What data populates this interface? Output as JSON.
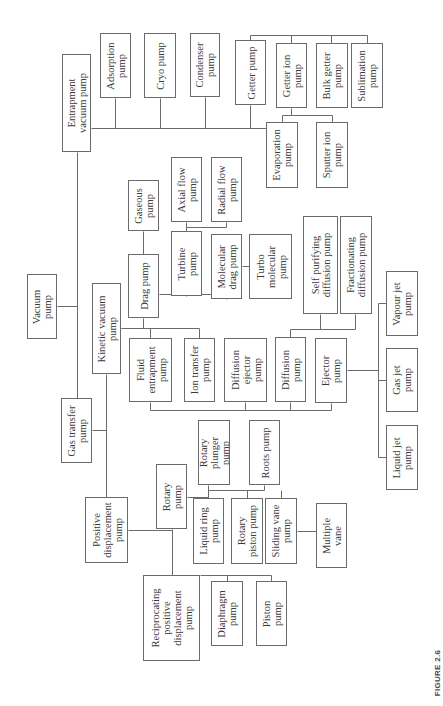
{
  "figure": {
    "caption": "FIGURE 2.6",
    "line_color": "#6b6b6b",
    "text_color": "#3a3a3a",
    "orientation": "rotated -90 degrees (text reads bottom-to-top)"
  },
  "nodes": [
    {
      "id": "vacuum",
      "label": "Vacuum\npump",
      "x": 27,
      "y": 274,
      "w": 30,
      "h": 65
    },
    {
      "id": "entrapment",
      "label": "Entrapment\nvacuum pump",
      "x": 62,
      "y": 54,
      "w": 29,
      "h": 98
    },
    {
      "id": "adsorption",
      "label": "Adsorption\npump",
      "x": 100,
      "y": 33,
      "w": 31,
      "h": 65
    },
    {
      "id": "cryo",
      "label": "Cryo pump",
      "x": 144,
      "y": 33,
      "w": 32,
      "h": 65
    },
    {
      "id": "condenser",
      "label": "Condenser\npump",
      "x": 190,
      "y": 33,
      "w": 30,
      "h": 64
    },
    {
      "id": "getter",
      "label": "Getter pump",
      "x": 235,
      "y": 40,
      "w": 31,
      "h": 65
    },
    {
      "id": "getter_ion",
      "label": "Getter ion\npump",
      "x": 276,
      "y": 43,
      "w": 31,
      "h": 65
    },
    {
      "id": "bulk_getter",
      "label": "Bulk getter\npump",
      "x": 316,
      "y": 43,
      "w": 32,
      "h": 65
    },
    {
      "id": "sublimation",
      "label": "Sublimation\npump",
      "x": 351,
      "y": 43,
      "w": 32,
      "h": 65
    },
    {
      "id": "evaporation",
      "label": "Evaporation\npump",
      "x": 266,
      "y": 122,
      "w": 32,
      "h": 66
    },
    {
      "id": "sputter_ion",
      "label": "Sputter ion\npump",
      "x": 316,
      "y": 122,
      "w": 32,
      "h": 66
    },
    {
      "id": "gas_transfer",
      "label": "Gas transfer\npump",
      "x": 61,
      "y": 398,
      "w": 31,
      "h": 65
    },
    {
      "id": "kinetic",
      "label": "Kinetic vacuum\npump",
      "x": 92,
      "y": 283,
      "w": 29,
      "h": 91
    },
    {
      "id": "drag",
      "label": "Drag pump",
      "x": 128,
      "y": 254,
      "w": 31,
      "h": 64
    },
    {
      "id": "gaseous",
      "label": "Gaseous\npump",
      "x": 128,
      "y": 180,
      "w": 31,
      "h": 51
    },
    {
      "id": "turbine",
      "label": "Turbine\npump",
      "x": 171,
      "y": 231,
      "w": 31,
      "h": 65
    },
    {
      "id": "axial_flow",
      "label": "Axial flow\npump",
      "x": 171,
      "y": 157,
      "w": 31,
      "h": 65
    },
    {
      "id": "radial_flow",
      "label": "Radial flow\npump",
      "x": 211,
      "y": 157,
      "w": 31,
      "h": 65
    },
    {
      "id": "molecular_drag",
      "label": "Molecular\ndrag pump",
      "x": 211,
      "y": 234,
      "w": 31,
      "h": 65
    },
    {
      "id": "turbo_molecular",
      "label": "Turbo\nmolecular\npump",
      "x": 249,
      "y": 234,
      "w": 43,
      "h": 65
    },
    {
      "id": "fluid_entrapment",
      "label": "Fluid\nentrapment\npump",
      "x": 129,
      "y": 338,
      "w": 43,
      "h": 64
    },
    {
      "id": "ion_transfer",
      "label": "Ion transfer\npump",
      "x": 184,
      "y": 338,
      "w": 31,
      "h": 64
    },
    {
      "id": "diffusion_ejector",
      "label": "Diffusion\nejector\npump",
      "x": 224,
      "y": 338,
      "w": 43,
      "h": 64
    },
    {
      "id": "diffusion",
      "label": "Diffusion\npump",
      "x": 275,
      "y": 337,
      "w": 31,
      "h": 65
    },
    {
      "id": "ejector",
      "label": "Ejector\npump",
      "x": 315,
      "y": 338,
      "w": 32,
      "h": 65
    },
    {
      "id": "self_purifying",
      "label": "Self purifying\ndiffusion pump",
      "x": 303,
      "y": 216,
      "w": 35,
      "h": 98
    },
    {
      "id": "fractionating",
      "label": "Fractionating\ndiffusion pump",
      "x": 340,
      "y": 216,
      "w": 32,
      "h": 98
    },
    {
      "id": "vapour_jet",
      "label": "Vapour jet\npump",
      "x": 386,
      "y": 271,
      "w": 32,
      "h": 65
    },
    {
      "id": "gas_jet",
      "label": "Gas jet\npump",
      "x": 386,
      "y": 348,
      "w": 32,
      "h": 64
    },
    {
      "id": "liquid_jet",
      "label": "Liquid jet\npump",
      "x": 386,
      "y": 425,
      "w": 32,
      "h": 65
    },
    {
      "id": "positive_displacement",
      "label": "Positive\ndisplacement\npump",
      "x": 85,
      "y": 497,
      "w": 43,
      "h": 66
    },
    {
      "id": "rotary",
      "label": "Rotary\npump",
      "x": 156,
      "y": 464,
      "w": 31,
      "h": 65
    },
    {
      "id": "rotary_plunger",
      "label": "Rotary\nplunger\npump",
      "x": 198,
      "y": 420,
      "w": 32,
      "h": 65
    },
    {
      "id": "roots",
      "label": "Roots pump",
      "x": 249,
      "y": 420,
      "w": 31,
      "h": 65
    },
    {
      "id": "liquid_ring",
      "label": "Liquid ring\npump",
      "x": 193,
      "y": 498,
      "w": 31,
      "h": 66
    },
    {
      "id": "rotary_piston",
      "label": "Rotary\npiston pump",
      "x": 231,
      "y": 498,
      "w": 32,
      "h": 66
    },
    {
      "id": "sliding_vane",
      "label": "Sliding vane\npump",
      "x": 265,
      "y": 498,
      "w": 32,
      "h": 66
    },
    {
      "id": "multiple_vane",
      "label": "Multiple\nvane",
      "x": 316,
      "y": 503,
      "w": 31,
      "h": 65
    },
    {
      "id": "reciprocating",
      "label": "Reciprocating\npositive\ndisplacement\npump",
      "x": 143,
      "y": 575,
      "w": 57,
      "h": 86
    },
    {
      "id": "diaphragm",
      "label": "Diaphragm\npump",
      "x": 211,
      "y": 581,
      "w": 32,
      "h": 65
    },
    {
      "id": "piston",
      "label": "Piston\npump",
      "x": 256,
      "y": 581,
      "w": 31,
      "h": 65
    }
  ],
  "edges": [
    [
      "vacuum",
      "entrapment"
    ],
    [
      "vacuum",
      "gas_transfer"
    ],
    [
      "entrapment",
      "adsorption"
    ],
    [
      "entrapment",
      "cryo"
    ],
    [
      "entrapment",
      "condenser"
    ],
    [
      "entrapment",
      "getter"
    ],
    [
      "getter",
      "getter_ion"
    ],
    [
      "getter",
      "bulk_getter"
    ],
    [
      "getter",
      "sublimation"
    ],
    [
      "getter_ion",
      "evaporation"
    ],
    [
      "getter_ion",
      "sputter_ion"
    ],
    [
      "gas_transfer",
      "kinetic"
    ],
    [
      "gas_transfer",
      "positive_displacement"
    ],
    [
      "kinetic",
      "drag"
    ],
    [
      "kinetic",
      "fluid_entrapment"
    ],
    [
      "kinetic",
      "ion_transfer"
    ],
    [
      "drag",
      "gaseous"
    ],
    [
      "drag",
      "turbine"
    ],
    [
      "drag",
      "molecular_drag"
    ],
    [
      "turbine",
      "axial_flow"
    ],
    [
      "turbine",
      "radial_flow"
    ],
    [
      "molecular_drag",
      "turbo_molecular"
    ],
    [
      "fluid_entrapment",
      "diffusion_ejector"
    ],
    [
      "fluid_entrapment",
      "diffusion"
    ],
    [
      "fluid_entrapment",
      "ejector"
    ],
    [
      "diffusion",
      "self_purifying"
    ],
    [
      "diffusion",
      "fractionating"
    ],
    [
      "ejector",
      "vapour_jet"
    ],
    [
      "ejector",
      "gas_jet"
    ],
    [
      "ejector",
      "liquid_jet"
    ],
    [
      "positive_displacement",
      "rotary"
    ],
    [
      "positive_displacement",
      "reciprocating"
    ],
    [
      "rotary",
      "rotary_plunger"
    ],
    [
      "rotary",
      "roots"
    ],
    [
      "rotary",
      "liquid_ring"
    ],
    [
      "rotary",
      "rotary_piston"
    ],
    [
      "rotary",
      "sliding_vane"
    ],
    [
      "sliding_vane",
      "multiple_vane"
    ],
    [
      "reciprocating",
      "diaphragm"
    ],
    [
      "reciprocating",
      "piston"
    ]
  ],
  "lines": [
    [
      57,
      306,
      77,
      306
    ],
    [
      77,
      152,
      77,
      398
    ],
    [
      91,
      128,
      266,
      128
    ],
    [
      115,
      98,
      115,
      128
    ],
    [
      160,
      98,
      160,
      128
    ],
    [
      205,
      97,
      205,
      128
    ],
    [
      250,
      105,
      250,
      128
    ],
    [
      250,
      40,
      250,
      35
    ],
    [
      250,
      35,
      367,
      35
    ],
    [
      291,
      35,
      291,
      43
    ],
    [
      331,
      35,
      331,
      43
    ],
    [
      367,
      35,
      367,
      43
    ],
    [
      291,
      108,
      291,
      115
    ],
    [
      282,
      115,
      332,
      115
    ],
    [
      282,
      115,
      282,
      122
    ],
    [
      332,
      115,
      332,
      122
    ],
    [
      92,
      430,
      106,
      430
    ],
    [
      106,
      374,
      106,
      497
    ],
    [
      121,
      328,
      143,
      328
    ],
    [
      143,
      318,
      143,
      328
    ],
    [
      121,
      328,
      199,
      328
    ],
    [
      150,
      328,
      150,
      338
    ],
    [
      199,
      328,
      199,
      338
    ],
    [
      143,
      231,
      143,
      254
    ],
    [
      159,
      294,
      226,
      294
    ],
    [
      186,
      296,
      186,
      294
    ],
    [
      226,
      299,
      226,
      294
    ],
    [
      186,
      222,
      186,
      231
    ],
    [
      186,
      227,
      226,
      227
    ],
    [
      226,
      222,
      226,
      227
    ],
    [
      242,
      266,
      249,
      266
    ],
    [
      150,
      402,
      150,
      410
    ],
    [
      150,
      410,
      331,
      410
    ],
    [
      245,
      402,
      245,
      410
    ],
    [
      290,
      402,
      290,
      410
    ],
    [
      331,
      403,
      331,
      410
    ],
    [
      290,
      337,
      290,
      329
    ],
    [
      290,
      329,
      355,
      329
    ],
    [
      320,
      314,
      320,
      329
    ],
    [
      355,
      314,
      355,
      329
    ],
    [
      347,
      370,
      378,
      370
    ],
    [
      378,
      303,
      378,
      457
    ],
    [
      378,
      303,
      386,
      303
    ],
    [
      378,
      380,
      386,
      380
    ],
    [
      378,
      457,
      386,
      457
    ],
    [
      128,
      530,
      172,
      530
    ],
    [
      172,
      529,
      172,
      575
    ],
    [
      187,
      497,
      208,
      497
    ],
    [
      208,
      485,
      208,
      497
    ],
    [
      208,
      490,
      264,
      490
    ],
    [
      264,
      485,
      264,
      490
    ],
    [
      208,
      490,
      208,
      498
    ],
    [
      247,
      490,
      247,
      498
    ],
    [
      281,
      490,
      281,
      498
    ],
    [
      297,
      531,
      316,
      531
    ],
    [
      200,
      575,
      271,
      575
    ],
    [
      227,
      575,
      227,
      581
    ],
    [
      271,
      575,
      271,
      581
    ]
  ]
}
